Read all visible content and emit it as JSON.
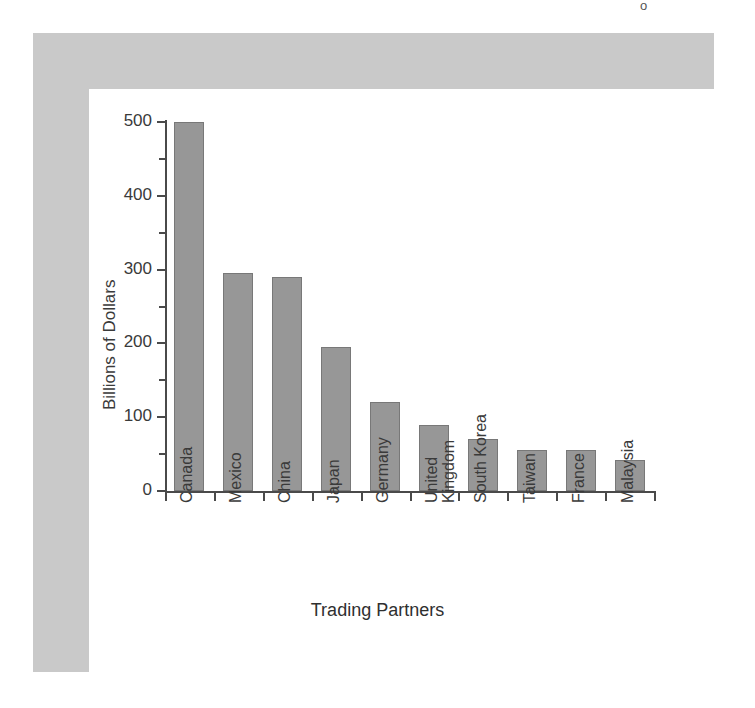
{
  "figure": {
    "frame_color": "#c9c9c9",
    "canvas_color": "#ffffff",
    "bar_color": "#979797",
    "bar_edge_color": "#787878",
    "axis_color": "#4a4a4a",
    "text_color": "#3a3a3a"
  },
  "bleed": {
    "top_line": "",
    "glyph": "o",
    "ghost_a": "",
    "ghost_b": "",
    "ghost_c": ""
  },
  "chart_data": {
    "type": "bar",
    "title": "",
    "xlabel": "Trading Partners",
    "ylabel": "Billions of Dollars",
    "categories": [
      "Canada",
      "Mexico",
      "China",
      "Japan",
      "Germany",
      "United Kingdom",
      "South Korea",
      "Taiwan",
      "France",
      "Malaysia"
    ],
    "category_lines": [
      [
        "Canada"
      ],
      [
        "Mexico"
      ],
      [
        "China"
      ],
      [
        "Japan"
      ],
      [
        "Germany"
      ],
      [
        "United",
        "Kingdom"
      ],
      [
        "South Korea"
      ],
      [
        "Taiwan"
      ],
      [
        "France"
      ],
      [
        "Malaysia"
      ]
    ],
    "values": [
      500,
      295,
      290,
      195,
      120,
      90,
      70,
      56,
      56,
      42
    ],
    "ylim": [
      0,
      500
    ],
    "y_major_ticks": [
      0,
      100,
      200,
      300,
      400,
      500
    ],
    "y_minor_ticks": [
      50,
      150,
      250,
      350,
      450
    ],
    "y_tick_labels": [
      "0",
      "100",
      "200",
      "300",
      "400",
      "500"
    ],
    "grid": false,
    "legend": false,
    "legend_position": "none",
    "units": "Billions of Dollars"
  }
}
